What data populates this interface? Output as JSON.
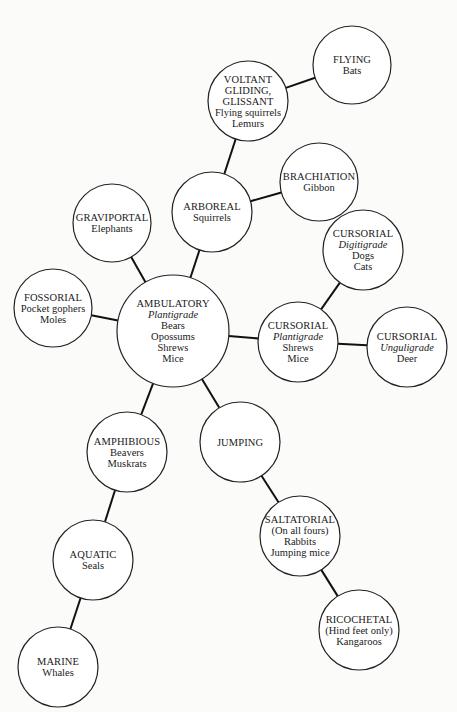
{
  "diagram": {
    "type": "mammal locomotion adaptation tree",
    "nodes": [
      {
        "id": "flying",
        "cx": 352,
        "cy": 65,
        "r": 39,
        "lines": [
          {
            "text": "FLYING"
          },
          {
            "text": "Bats"
          }
        ]
      },
      {
        "id": "voltant",
        "cx": 248,
        "cy": 101,
        "r": 40,
        "lines": [
          {
            "text": "VOLTANT"
          },
          {
            "text": "GLIDING,"
          },
          {
            "text": "GLISSANT"
          },
          {
            "text": "Flying squirrels"
          },
          {
            "text": "Lemurs"
          }
        ]
      },
      {
        "id": "brachiation",
        "cx": 319,
        "cy": 182,
        "r": 39,
        "lines": [
          {
            "text": "BRACHIATION"
          },
          {
            "text": "Gibbon"
          }
        ]
      },
      {
        "id": "arboreal",
        "cx": 212,
        "cy": 212,
        "r": 40,
        "lines": [
          {
            "text": "ARBOREAL"
          },
          {
            "text": "Squirrels"
          }
        ]
      },
      {
        "id": "graviportal",
        "cx": 112,
        "cy": 223,
        "r": 39,
        "lines": [
          {
            "text": "GRAVIPORTAL"
          },
          {
            "text": "Elephants"
          }
        ]
      },
      {
        "id": "cursorial-digitigrade",
        "cx": 363,
        "cy": 250,
        "r": 40,
        "lines": [
          {
            "text": "CURSORIAL"
          },
          {
            "text": "Digitigrade",
            "italic": true
          },
          {
            "text": "Dogs"
          },
          {
            "text": "Cats"
          }
        ]
      },
      {
        "id": "fossorial",
        "cx": 53,
        "cy": 308,
        "r": 39,
        "lines": [
          {
            "text": "FOSSORIAL"
          },
          {
            "text": "Pocket gophers"
          },
          {
            "text": "Moles"
          }
        ]
      },
      {
        "id": "ambulatory",
        "cx": 173,
        "cy": 331,
        "r": 56,
        "lines": [
          {
            "text": "AMBULATORY"
          },
          {
            "text": "Plantigrade",
            "italic": true
          },
          {
            "text": "Bears"
          },
          {
            "text": "Opossums"
          },
          {
            "text": "Shrews"
          },
          {
            "text": "Mice"
          }
        ]
      },
      {
        "id": "cursorial-plantigrade",
        "cx": 298,
        "cy": 342,
        "r": 40,
        "lines": [
          {
            "text": "CURSORIAL"
          },
          {
            "text": "Plantigrade",
            "italic": true
          },
          {
            "text": "Shrews"
          },
          {
            "text": "Mice"
          }
        ]
      },
      {
        "id": "cursorial-unguligrade",
        "cx": 407,
        "cy": 347,
        "r": 40,
        "lines": [
          {
            "text": "CURSORIAL"
          },
          {
            "text": "Unguligrade",
            "italic": true
          },
          {
            "text": "Deer"
          }
        ]
      },
      {
        "id": "jumping",
        "cx": 240,
        "cy": 442,
        "r": 40,
        "lines": [
          {
            "text": "JUMPING"
          }
        ]
      },
      {
        "id": "amphibious",
        "cx": 127,
        "cy": 452,
        "r": 40,
        "lines": [
          {
            "text": "AMPHIBIOUS"
          },
          {
            "text": "Beavers"
          },
          {
            "text": "Muskrats"
          }
        ]
      },
      {
        "id": "saltatorial",
        "cx": 300,
        "cy": 536,
        "r": 40,
        "lines": [
          {
            "text": "SALTATORIAL"
          },
          {
            "text": "(On all fours)"
          },
          {
            "text": "Rabbits"
          },
          {
            "text": "Jumping mice"
          }
        ]
      },
      {
        "id": "aquatic",
        "cx": 93,
        "cy": 560,
        "r": 40,
        "lines": [
          {
            "text": "AQUATIC"
          },
          {
            "text": "Seals"
          }
        ]
      },
      {
        "id": "ricochetal",
        "cx": 359,
        "cy": 630,
        "r": 40,
        "lines": [
          {
            "text": "RICOCHETAL"
          },
          {
            "text": "(Hind feet only)"
          },
          {
            "text": "Kangaroos"
          }
        ]
      },
      {
        "id": "marine",
        "cx": 58,
        "cy": 667,
        "r": 40,
        "lines": [
          {
            "text": "MARINE"
          },
          {
            "text": "Whales"
          }
        ]
      }
    ],
    "edges": [
      [
        "voltant",
        "flying"
      ],
      [
        "arboreal",
        "voltant"
      ],
      [
        "arboreal",
        "brachiation"
      ],
      [
        "ambulatory",
        "arboreal"
      ],
      [
        "ambulatory",
        "graviportal"
      ],
      [
        "ambulatory",
        "fossorial"
      ],
      [
        "ambulatory",
        "cursorial-plantigrade"
      ],
      [
        "cursorial-plantigrade",
        "cursorial-digitigrade"
      ],
      [
        "cursorial-plantigrade",
        "cursorial-unguligrade"
      ],
      [
        "ambulatory",
        "jumping"
      ],
      [
        "ambulatory",
        "amphibious"
      ],
      [
        "jumping",
        "saltatorial"
      ],
      [
        "saltatorial",
        "ricochetal"
      ],
      [
        "amphibious",
        "aquatic"
      ],
      [
        "aquatic",
        "marine"
      ]
    ]
  }
}
